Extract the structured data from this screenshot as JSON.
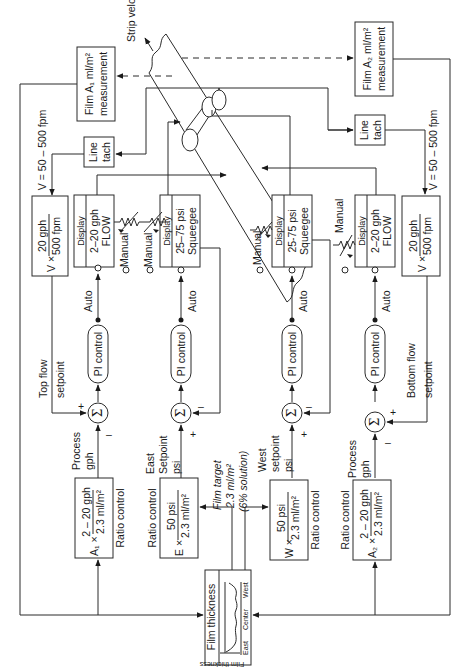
{
  "diagram": {
    "orientation": "rotated-90-ccw",
    "strip": {
      "label": "Strip velocity"
    },
    "measurements": {
      "film_a1": {
        "line1": "Film A₁ ml/m²",
        "line2": "measurement"
      },
      "film_a2": {
        "line1": "Film A₂ ml/m²",
        "line2": "measurement"
      }
    },
    "line_tach": {
      "left": {
        "line1": "Line",
        "line2": "tach"
      },
      "right": {
        "line1": "Line",
        "line2": "tach"
      }
    },
    "velocity_range": {
      "left": "V = 50 – 500 fpm",
      "right": "V = 50 – 500 fpm"
    },
    "velocity_ratio": {
      "left": {
        "prefix": "V ×",
        "numerator": "20 gph",
        "denominator": "500 fpm"
      },
      "right": {
        "prefix": "V ×",
        "numerator": "20 gph",
        "denominator": "500 fpm"
      }
    },
    "displays": [
      {
        "id": "top-flow",
        "header": "Display",
        "line1": "2–20 gph",
        "line2": "FLOW"
      },
      {
        "id": "east-squeegee",
        "header": "Display",
        "line1": "25–75 psi",
        "line2": "Squeegee"
      },
      {
        "id": "west-squeegee",
        "header": "Display",
        "line1": "25-75 psi",
        "line2": "Squeegee"
      },
      {
        "id": "bottom-flow",
        "header": "Display",
        "line1": "2–20 gph",
        "line2": "FLOW"
      }
    ],
    "mode_labels": {
      "manual": "Manual",
      "auto": "Auto"
    },
    "pi_control_label": "PI control",
    "summing_symbol": "Σ",
    "signs": {
      "plus": "+",
      "minus": "–"
    },
    "setpoint_labels": {
      "top_flow": {
        "line1": "Top flow",
        "line2": "setpoint"
      },
      "bottom_flow": {
        "line1": "Bottom flow",
        "line2": "setpoint"
      }
    },
    "process_labels": {
      "top": {
        "line1": "Process",
        "line2": "gph"
      },
      "east": {
        "line1": "East",
        "line2": "Setpoint",
        "line3": "psi"
      },
      "west": {
        "line1": "West",
        "line2": "setpoint",
        "line3": "psi"
      },
      "bottom": {
        "line1": "Process",
        "line2": "gph"
      }
    },
    "ratio_controls": [
      {
        "id": "a1",
        "prefix": "A₁ ×",
        "numerator": "2 – 20 gph",
        "denominator": "2.3 ml/m²",
        "label": "Ratio control"
      },
      {
        "id": "east",
        "prefix": "E ×",
        "numerator": "50 psi",
        "denominator": "2.3 ml/m²",
        "label": "Ratio control"
      },
      {
        "id": "west",
        "prefix": "W ×",
        "numerator": "50 psi",
        "denominator": "2.3 ml/m²",
        "label": "Ratio control"
      },
      {
        "id": "a2",
        "prefix": "A₂ ×",
        "numerator": "2 – 20 gph",
        "denominator": "2.3 ml/m²",
        "label": "Ratio control"
      }
    ],
    "film_target": {
      "line1": "Film target",
      "line2": "2.3 ml/m²",
      "line3": "(6% solution)"
    },
    "film_thickness": {
      "title": "Film thickness",
      "axis_label": "Film thickness",
      "positions": [
        "East",
        "Center",
        "West"
      ]
    }
  }
}
